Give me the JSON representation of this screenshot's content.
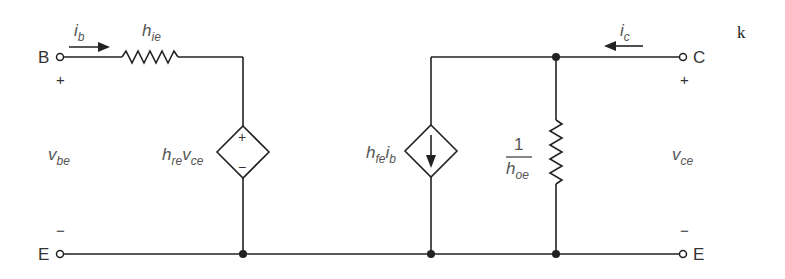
{
  "diagram": {
    "type": "BJT hybrid-parameter (h-parameter) small-signal equivalent circuit",
    "stroke_color": "#222222",
    "label_color": "#555555",
    "terminals": {
      "base": "B",
      "collector": "C",
      "emitter_left": "E",
      "emitter_right": "E"
    },
    "currents": {
      "base": {
        "main": "i",
        "sub": "b"
      },
      "collector": {
        "main": "i",
        "sub": "c"
      }
    },
    "components": {
      "input_resistor": {
        "main": "h",
        "sub": "ie"
      },
      "voltage_source": {
        "coef_main": "h",
        "coef_sub": "re",
        "var_main": "v",
        "var_sub": "ce",
        "plus": "+",
        "minus": "−"
      },
      "current_source": {
        "coef_main": "h",
        "coef_sub": "fe",
        "var_main": "i",
        "var_sub": "b"
      },
      "output_conductance": {
        "numerator": "1",
        "den_main": "h",
        "den_sub": "oe"
      }
    },
    "port_voltages": {
      "input": {
        "main": "v",
        "sub": "be",
        "plus": "+",
        "minus": "−"
      },
      "output": {
        "main": "v",
        "sub": "ce",
        "plus": "+",
        "minus": "−"
      }
    },
    "corner_mark": "k"
  }
}
